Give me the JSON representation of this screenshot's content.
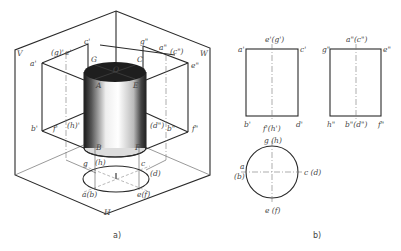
{
  "figure": {
    "captions": {
      "a": "a)",
      "b": "b)"
    },
    "pictorial": {
      "planes": {
        "V": "V",
        "W": "W",
        "H": "H"
      },
      "front_projection_labels": {
        "a1": "a'",
        "g1": "(g)'",
        "e1": "e'",
        "c1": "c'",
        "b1": "b'",
        "f1": "f'",
        "h1": "(h)'"
      },
      "side_projection_labels": {
        "g2": "g\"",
        "a2": "a\"",
        "c2": "(c\")",
        "e2": "e\"",
        "d2": "(d\")",
        "b2": "b\"",
        "f2": "f\""
      },
      "cylinder_points": {
        "G": "G",
        "C": "C",
        "O": "O",
        "A": "A",
        "E": "E",
        "B": "B",
        "F": "F"
      },
      "plan_labels": {
        "g": "g",
        "h": "(h)",
        "c": "c",
        "d": "(d)",
        "ab": "a(b)",
        "ef": "e(f)"
      }
    },
    "orthographic": {
      "front_view": {
        "top": "e'(g')",
        "tl": "a'",
        "tr": "c'",
        "bl": "b'",
        "bottom": "f'(h')",
        "br": "d'"
      },
      "side_view": {
        "top": "a\"(c\")",
        "tl": "g\"",
        "tr": "e\"",
        "bl": "h\"",
        "bottom": "b\"(d\")",
        "br": "f\""
      },
      "top_view": {
        "top": "g (h)",
        "left_a": "a",
        "left_b": "(b)",
        "right": "c (d)",
        "bottom": "e (f)"
      }
    },
    "colors": {
      "line": "#2a2a2a",
      "label": "#444444",
      "cylinder_top": "#1e1e1e"
    }
  }
}
